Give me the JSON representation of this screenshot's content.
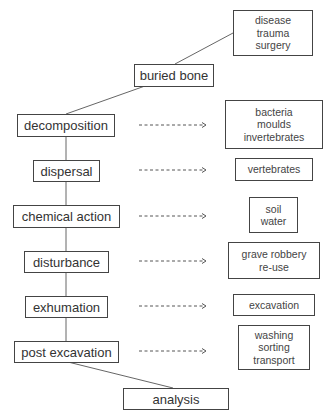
{
  "stages": [
    {
      "id": "buried-bone",
      "label": "buried bone"
    },
    {
      "id": "decomposition",
      "label": "decomposition"
    },
    {
      "id": "dispersal",
      "label": "dispersal"
    },
    {
      "id": "chemical-action",
      "label": "chemical action"
    },
    {
      "id": "disturbance",
      "label": "disturbance"
    },
    {
      "id": "exhumation",
      "label": "exhumation"
    },
    {
      "id": "post-excavation",
      "label": "post excavation"
    },
    {
      "id": "analysis",
      "label": "analysis"
    }
  ],
  "agents": {
    "antemortem": [
      "disease",
      "trauma",
      "surgery"
    ],
    "decomposition": [
      "bacteria",
      "moulds",
      "invertebrates"
    ],
    "dispersal": [
      "vertebrates"
    ],
    "chemical_action": [
      "soil",
      "water"
    ],
    "disturbance": [
      "grave robbery",
      "re-use"
    ],
    "exhumation": [
      "excavation"
    ],
    "post_excavation": [
      "washing",
      "sorting",
      "transport"
    ]
  },
  "colors": {
    "line": "#555555",
    "border": "#444444",
    "text": "#333333"
  }
}
